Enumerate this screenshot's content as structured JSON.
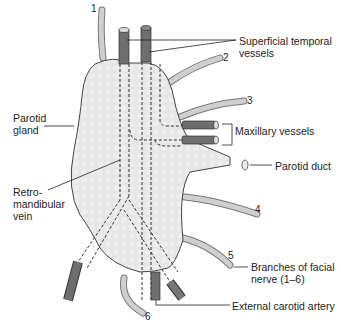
{
  "diagram": {
    "colors": {
      "gland_fill": "#e4e4e4",
      "gland_stroke": "#444444",
      "vessel_dark": "#6e6e6e",
      "nerve_light": "#c8c8c8",
      "label_text": "#222222"
    },
    "labels": {
      "superficial_temporal_line1": "Superficial temporal",
      "superficial_temporal_line2": "vessels",
      "parotid_gland_line1": "Parotid",
      "parotid_gland_line2": "gland",
      "maxillary": "Maxillary vessels",
      "parotid_duct": "Parotid duct",
      "retromandibular_line1": "Retro-",
      "retromandibular_line2": "mandibular",
      "retromandibular_line3": "vein",
      "facial_nerve_line1": "Branches of facial",
      "facial_nerve_line2": "nerve (1–6)",
      "external_carotid": "External carotid artery"
    },
    "nerve_numbers": [
      "1",
      "2",
      "3",
      "4",
      "5",
      "6"
    ]
  }
}
